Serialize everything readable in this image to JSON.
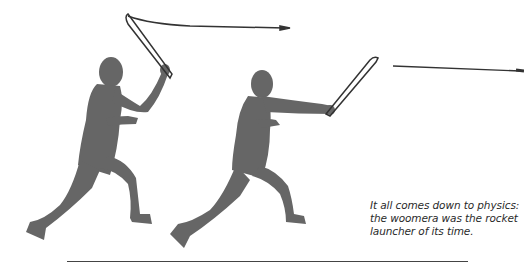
{
  "figure": {
    "silhouette_color": "#666666",
    "spear_color": "#333333"
  },
  "caption": {
    "lines": [
      "It all comes down to physics:",
      "the woomera was the rocket",
      "launcher of its time."
    ]
  }
}
